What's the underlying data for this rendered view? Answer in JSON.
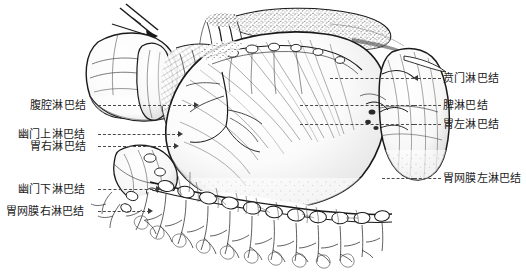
{
  "figure": {
    "title_visible": false,
    "style": "pen-and-ink stipple anatomical illustration",
    "background_color": "#ffffff",
    "ink_color": "#1a1a1a",
    "leader_line_color": "#4a4a4a",
    "leader_line_style": "dashed"
  },
  "labels_left": [
    {
      "id": "celiac",
      "text": "腹腔淋巴结",
      "x": 30,
      "y": 99,
      "leader_from": 98,
      "leader_to": 196,
      "leader_y": 105
    },
    {
      "id": "suprapyloric",
      "text": "幽门上淋巴结",
      "x": 18,
      "y": 128,
      "leader_from": 98,
      "leader_to": 180,
      "leader_y": 134
    },
    {
      "id": "right-gastric",
      "text": "胃右淋巴结",
      "x": 30,
      "y": 140,
      "leader_from": 98,
      "leader_to": 176,
      "leader_y": 146
    },
    {
      "id": "subpyloric",
      "text": "幽门下淋巴结",
      "x": 18,
      "y": 183,
      "leader_from": 98,
      "leader_to": 158,
      "leader_y": 189
    },
    {
      "id": "right-gastroomental",
      "text": "胃网膜右淋巴结",
      "x": 6,
      "y": 205,
      "leader_from": 98,
      "leader_to": 150,
      "leader_y": 211
    }
  ],
  "labels_right": [
    {
      "id": "cardiac",
      "text": "贲门淋巴结",
      "x": 443,
      "y": 72,
      "leader_from": 418,
      "leader_to": 441,
      "leader_y": 78
    },
    {
      "id": "splenic",
      "text": "脾淋巴结",
      "x": 443,
      "y": 99,
      "leader_from": 414,
      "leader_to": 441,
      "leader_y": 105
    },
    {
      "id": "left-gastric",
      "text": "胃左淋巴结",
      "x": 443,
      "y": 118,
      "leader_from": 414,
      "leader_to": 441,
      "leader_y": 124
    },
    {
      "id": "left-gastroomental",
      "text": "胃网膜左淋巴结",
      "x": 443,
      "y": 172,
      "leader_from": 414,
      "leader_to": 441,
      "leader_y": 178
    }
  ],
  "anatomy_parts": [
    {
      "name": "liver-left-lobe",
      "note": "upper left, smooth lobe with ligament"
    },
    {
      "name": "gallbladder",
      "note": "pear-shaped under liver edge"
    },
    {
      "name": "surgical-retractor",
      "note": "thin crossed instrument top left"
    },
    {
      "name": "esophagus-cardia",
      "note": "stippled tube entering stomach top"
    },
    {
      "name": "diaphragm-crus",
      "note": "stippled band across upper area"
    },
    {
      "name": "stomach-body",
      "note": "large smooth mass, center right"
    },
    {
      "name": "lesser-omentum",
      "note": "fibrous striated sheet left of stomach"
    },
    {
      "name": "spleen",
      "note": "kidney-shaped organ far right"
    },
    {
      "name": "splenic-vessels",
      "note": "vessels at splenic hilum"
    },
    {
      "name": "greater-omentum",
      "note": "fringed apron below stomach"
    },
    {
      "name": "lymph-node-chain",
      "note": "beaded nodes along greater curvature"
    },
    {
      "name": "duodenum",
      "note": "lower left curved segment"
    }
  ]
}
